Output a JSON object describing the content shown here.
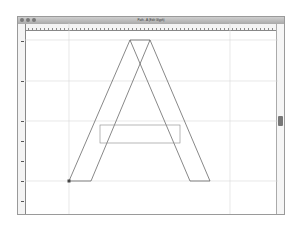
{
  "window": {
    "title": "Path - A (Edit Glyph)",
    "controls": [
      "close",
      "minimize",
      "zoom"
    ]
  },
  "rulers": {
    "horizontal_ticks": 7,
    "vertical_ticks": 7
  },
  "canvas": {
    "grid": {
      "horizontal_lines_y": [
        40,
        81,
        121,
        181
      ],
      "vertical_lines_x": [
        69,
        230
      ],
      "color": "#d8d8d8"
    },
    "glyph": {
      "name": "A",
      "outline_color": "#555555",
      "left_leg": {
        "outer_bottom": [
          69,
          181
        ],
        "inner_bottom": [
          91,
          181
        ],
        "outer_top": [
          130,
          40
        ],
        "inner_top": [
          150,
          40
        ]
      },
      "right_leg": {
        "outer_top": [
          150,
          40
        ],
        "inner_top": [
          130,
          40
        ],
        "inner_bottom": [
          190,
          181
        ],
        "outer_bottom": [
          210,
          181
        ]
      },
      "crossbar": {
        "x": 100,
        "y": 125,
        "width": 80,
        "height": 18,
        "color": "#888888"
      },
      "selected_point": [
        69,
        181
      ]
    }
  },
  "scrollbar": {
    "thumb_position": "middle"
  }
}
